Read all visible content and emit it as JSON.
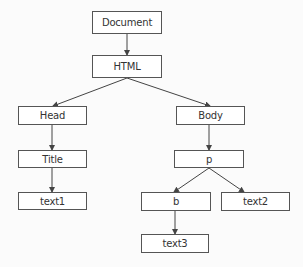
{
  "diagram": {
    "type": "tree",
    "colors": {
      "line": "#444444",
      "border": "#555555",
      "background": "#fbfbfb",
      "text": "#333333"
    },
    "nodes": {
      "document": {
        "label": "Document",
        "x": 92,
        "y": 11,
        "w": 70,
        "h": 23
      },
      "html": {
        "label": "HTML",
        "x": 92,
        "y": 55,
        "w": 70,
        "h": 23
      },
      "head": {
        "label": "Head",
        "x": 18,
        "y": 106,
        "w": 69,
        "h": 19
      },
      "body": {
        "label": "Body",
        "x": 176,
        "y": 106,
        "w": 69,
        "h": 19
      },
      "title": {
        "label": "Title",
        "x": 18,
        "y": 150,
        "w": 69,
        "h": 18
      },
      "p": {
        "label": "p",
        "x": 174,
        "y": 150,
        "w": 70,
        "h": 18
      },
      "text1": {
        "label": "text1",
        "x": 18,
        "y": 192,
        "w": 69,
        "h": 18
      },
      "b": {
        "label": "b",
        "x": 141,
        "y": 192,
        "w": 70,
        "h": 19
      },
      "text2": {
        "label": "text2",
        "x": 221,
        "y": 192,
        "w": 69,
        "h": 19
      },
      "text3": {
        "label": "text3",
        "x": 141,
        "y": 234,
        "w": 68,
        "h": 19
      }
    },
    "edges": [
      {
        "from": "Document",
        "to": "HTML"
      },
      {
        "from": "HTML",
        "to": "Head"
      },
      {
        "from": "HTML",
        "to": "Body"
      },
      {
        "from": "Head",
        "to": "Title"
      },
      {
        "from": "Title",
        "to": "text1"
      },
      {
        "from": "Body",
        "to": "p"
      },
      {
        "from": "p",
        "to": "b"
      },
      {
        "from": "p",
        "to": "text2"
      },
      {
        "from": "b",
        "to": "text3"
      }
    ]
  }
}
